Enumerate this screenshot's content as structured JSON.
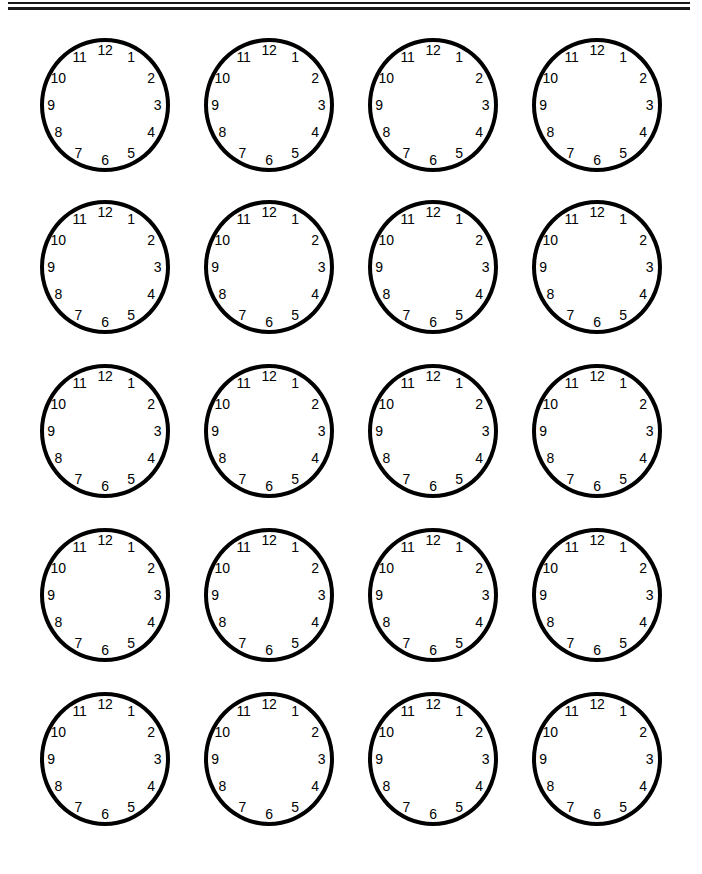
{
  "page": {
    "background_color": "#ffffff",
    "ink_color": "#000000",
    "width": 702,
    "height": 874
  },
  "header_rules": {
    "count": 2,
    "color": "#1a1a1a",
    "left": 8,
    "right": 690,
    "lines": [
      {
        "name": "upper-rule",
        "y": 3,
        "thickness": 2
      },
      {
        "name": "lower-rule",
        "y": 8,
        "thickness": 3
      }
    ]
  },
  "clock_grid": {
    "columns": 4,
    "rows": 5,
    "total_clocks": 20,
    "clock_diameter": 130,
    "column_x": [
      40,
      204,
      368,
      532
    ],
    "row_y": [
      38,
      200,
      364,
      528,
      692
    ],
    "border_width": 4,
    "border_color": "#000000",
    "face_color": "#ffffff"
  },
  "clock": {
    "numerals": [
      "1",
      "2",
      "3",
      "4",
      "5",
      "6",
      "7",
      "8",
      "9",
      "10",
      "11",
      "12"
    ],
    "numeral_positions": [
      {
        "label": "12",
        "angle_deg": 0,
        "x_pct": 50.0,
        "y_pct": 9.0
      },
      {
        "label": "1",
        "angle_deg": 30,
        "x_pct": 70.0,
        "y_pct": 14.5
      },
      {
        "label": "2",
        "angle_deg": 60,
        "x_pct": 85.5,
        "y_pct": 29.5
      },
      {
        "label": "3",
        "angle_deg": 90,
        "x_pct": 90.5,
        "y_pct": 50.0
      },
      {
        "label": "4",
        "angle_deg": 120,
        "x_pct": 85.5,
        "y_pct": 70.5
      },
      {
        "label": "5",
        "angle_deg": 150,
        "x_pct": 70.0,
        "y_pct": 85.5
      },
      {
        "label": "6",
        "angle_deg": 180,
        "x_pct": 50.0,
        "y_pct": 91.0
      },
      {
        "label": "7",
        "angle_deg": 210,
        "x_pct": 29.5,
        "y_pct": 85.5
      },
      {
        "label": "8",
        "angle_deg": 240,
        "x_pct": 14.0,
        "y_pct": 70.5
      },
      {
        "label": "9",
        "angle_deg": 270,
        "x_pct": 8.5,
        "y_pct": 50.0
      },
      {
        "label": "10",
        "angle_deg": 300,
        "x_pct": 14.0,
        "y_pct": 29.5
      },
      {
        "label": "11",
        "angle_deg": 330,
        "x_pct": 30.5,
        "y_pct": 14.5
      }
    ],
    "has_hands": false,
    "has_center_dot": false,
    "has_tick_marks": false
  },
  "clocks": [
    {
      "index": 1,
      "row": 1,
      "col": 1,
      "time": ""
    },
    {
      "index": 2,
      "row": 1,
      "col": 2,
      "time": ""
    },
    {
      "index": 3,
      "row": 1,
      "col": 3,
      "time": ""
    },
    {
      "index": 4,
      "row": 1,
      "col": 4,
      "time": ""
    },
    {
      "index": 5,
      "row": 2,
      "col": 1,
      "time": ""
    },
    {
      "index": 6,
      "row": 2,
      "col": 2,
      "time": ""
    },
    {
      "index": 7,
      "row": 2,
      "col": 3,
      "time": ""
    },
    {
      "index": 8,
      "row": 2,
      "col": 4,
      "time": ""
    },
    {
      "index": 9,
      "row": 3,
      "col": 1,
      "time": ""
    },
    {
      "index": 10,
      "row": 3,
      "col": 2,
      "time": ""
    },
    {
      "index": 11,
      "row": 3,
      "col": 3,
      "time": ""
    },
    {
      "index": 12,
      "row": 3,
      "col": 4,
      "time": ""
    },
    {
      "index": 13,
      "row": 4,
      "col": 1,
      "time": ""
    },
    {
      "index": 14,
      "row": 4,
      "col": 2,
      "time": ""
    },
    {
      "index": 15,
      "row": 4,
      "col": 3,
      "time": ""
    },
    {
      "index": 16,
      "row": 4,
      "col": 4,
      "time": ""
    },
    {
      "index": 17,
      "row": 5,
      "col": 1,
      "time": ""
    },
    {
      "index": 18,
      "row": 5,
      "col": 2,
      "time": ""
    },
    {
      "index": 19,
      "row": 5,
      "col": 3,
      "time": ""
    },
    {
      "index": 20,
      "row": 5,
      "col": 4,
      "time": ""
    }
  ]
}
